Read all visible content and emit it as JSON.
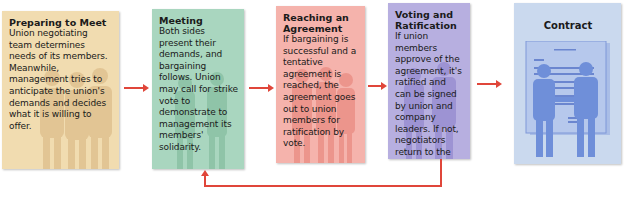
{
  "diagram": {
    "type": "process-flow",
    "colors": {
      "arrow": "#e0463a",
      "step1": "#f1dcb0",
      "step2": "#a9d6bf",
      "step3": "#f5b3ac",
      "step4": "#b7afe0",
      "step5": "#cad9ee"
    },
    "steps": [
      {
        "title": "Preparing to Meet",
        "text": "Union negotiating team determines needs of its members. Meanwhile, management tries to anticipate the union's demands and decides what it is willing to offer."
      },
      {
        "title": "Meeting",
        "text": "Both sides present their demands, and bargaining follows. Union may call for strike vote to demonstrate to management its members' solidarity."
      },
      {
        "title": "Reaching an Agreement",
        "text": "If bargaining is successful and a tentative agreement is reached, the agreement goes out to union members for ratification by vote."
      },
      {
        "title": "Voting and Ratification",
        "text": "If union members approve of the agreement, it's ratified and can be signed by union and company leaders. If not, negotiators return to the bargaining table."
      },
      {
        "title": "Contract",
        "text": ""
      }
    ],
    "connectors": [
      {
        "from": "Preparing to Meet",
        "to": "Meeting"
      },
      {
        "from": "Meeting",
        "to": "Reaching an Agreement"
      },
      {
        "from": "Reaching an Agreement",
        "to": "Voting and Ratification"
      },
      {
        "from": "Voting and Ratification",
        "to": "Contract"
      },
      {
        "from": "Voting and Ratification",
        "to": "Meeting",
        "kind": "feedback-loop"
      }
    ]
  }
}
